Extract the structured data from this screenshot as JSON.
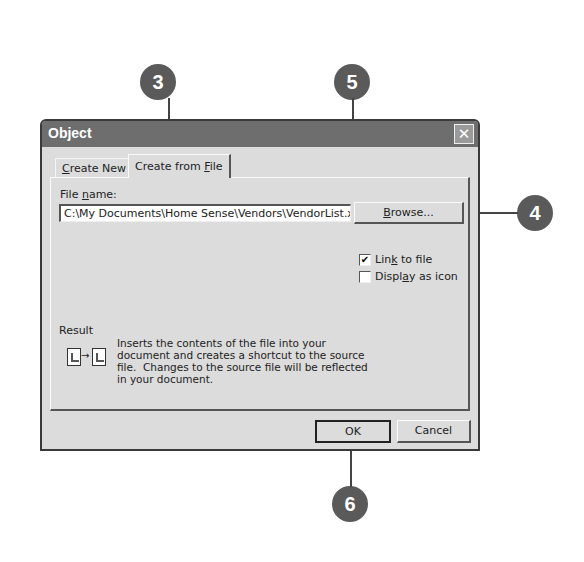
{
  "callouts": [
    {
      "number": "3"
    },
    {
      "number": "5"
    },
    {
      "number": "4"
    },
    {
      "number": "6"
    }
  ],
  "dialog": {
    "title": "Object",
    "close_icon": "close-icon",
    "tabs": [
      {
        "label": "Create New",
        "mnemonic": "C",
        "rest": "reate New",
        "active": false
      },
      {
        "label": "Create from File",
        "prefix": "Create from ",
        "mnemonic": "F",
        "rest": "ile",
        "active": true
      }
    ],
    "file_name_label_prefix": "File ",
    "file_name_label_mnemonic": "n",
    "file_name_label_rest": "ame:",
    "file_name_value": "C:\\My Documents\\Home Sense\\Vendors\\VendorList.xls",
    "browse_button": {
      "mnemonic": "B",
      "rest": "rowse..."
    },
    "link_to_file": {
      "prefix": "Lin",
      "mnemonic": "k",
      "rest": " to file",
      "checked": true,
      "check_glyph": "✔"
    },
    "display_as_icon": {
      "prefix": "Displ",
      "mnemonic": "a",
      "rest": "y as icon",
      "checked": false
    },
    "result": {
      "label": "Result",
      "line1": "Inserts the contents of the file into your",
      "line2": "document and creates a shortcut to the source",
      "line3": "file.  Changes to the source file will be reflected",
      "line4": "in your document.",
      "arrow_glyph": "→"
    },
    "ok_button": "OK",
    "cancel_button": "Cancel"
  }
}
